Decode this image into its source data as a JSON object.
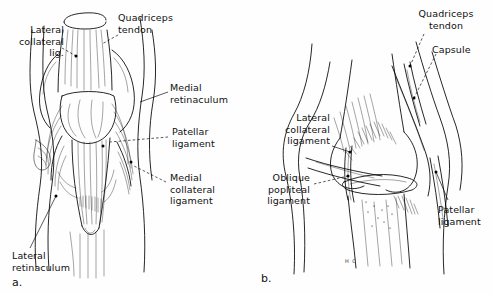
{
  "figure": {
    "ink_color": "#000000",
    "background_color": "#ffffff",
    "panels": [
      {
        "letter": "a.",
        "view": "anterior",
        "labels": [
          {
            "id": "lateral-collateral-lig",
            "text": "Lateral\ncollateral\nlig.",
            "align": "right"
          },
          {
            "id": "quadriceps-tendon",
            "text": "Quadriceps\ntendon",
            "align": "left"
          },
          {
            "id": "medial-retinaculum",
            "text": "Medial\nretinaculum",
            "align": "left"
          },
          {
            "id": "patellar-ligament",
            "text": "Patellar\nligament",
            "align": "left"
          },
          {
            "id": "medial-collateral-ligament",
            "text": "Medial\ncollateral\nligament",
            "align": "left"
          },
          {
            "id": "lateral-retinaculum",
            "text": "Lateral\n retinaculum",
            "align": "left"
          }
        ]
      },
      {
        "letter": "b.",
        "view": "posterolateral",
        "signature": "H C",
        "labels": [
          {
            "id": "quadriceps-tendon",
            "text": "Quadriceps\ntendon",
            "align": "center"
          },
          {
            "id": "capsule",
            "text": "Capsule",
            "align": "left"
          },
          {
            "id": "lateral-collateral-ligament",
            "text": "Lateral\ncollateral\nligament",
            "align": "right"
          },
          {
            "id": "oblique-popliteal-ligament",
            "text": "Oblique\npopliteal\nligament",
            "align": "right"
          },
          {
            "id": "patellar-ligament",
            "text": "Patellar\nligament",
            "align": "left"
          }
        ]
      }
    ]
  }
}
